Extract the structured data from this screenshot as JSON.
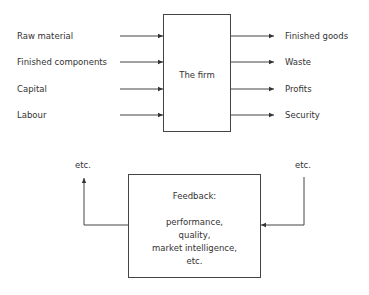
{
  "diagram": {
    "firm": {
      "label": "The firm"
    },
    "inputs": [
      {
        "label": "Raw material"
      },
      {
        "label": "Finished components"
      },
      {
        "label": "Capital"
      },
      {
        "label": "Labour"
      }
    ],
    "outputs": [
      {
        "label": "Finished goods"
      },
      {
        "label": "Waste"
      },
      {
        "label": "Profits"
      },
      {
        "label": "Security"
      }
    ],
    "feedback": {
      "title": "Feedback:",
      "lines": [
        "performance,",
        "quality,",
        "market intelligence,",
        "etc."
      ],
      "left_label": "etc.",
      "right_label": "etc."
    },
    "line_color": "#333333"
  }
}
